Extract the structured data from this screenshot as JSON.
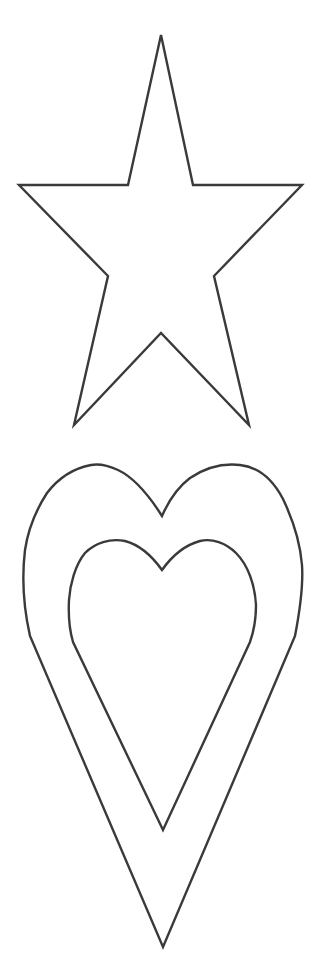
{
  "figure": {
    "background": "#ffffff",
    "stroke_color": "#3a3a3a",
    "shapes": [
      {
        "name": "star",
        "type": "five-point-star",
        "style": "outline"
      },
      {
        "name": "outer-heart",
        "type": "heart",
        "style": "outline"
      },
      {
        "name": "inner-heart",
        "type": "heart",
        "style": "outline"
      }
    ]
  }
}
